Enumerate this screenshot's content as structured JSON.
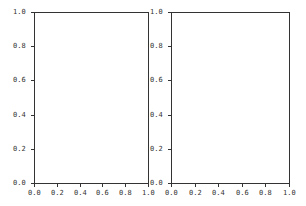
{
  "chart_data": [
    {
      "type": "line",
      "title": "",
      "xlabel": "",
      "ylabel": "",
      "xlim": [
        0.0,
        1.0
      ],
      "ylim": [
        0.0,
        1.0
      ],
      "grid": false,
      "series": [],
      "xticks": [
        "0.0",
        "0.2",
        "0.4",
        "0.6",
        "0.8",
        "1.0"
      ],
      "yticks": [
        "0.0",
        "0.2",
        "0.4",
        "0.6",
        "0.8",
        "1.0"
      ]
    },
    {
      "type": "line",
      "title": "",
      "xlabel": "",
      "ylabel": "",
      "xlim": [
        0.0,
        1.0
      ],
      "ylim": [
        0.0,
        1.0
      ],
      "grid": false,
      "series": [],
      "xticks": [
        "0.0",
        "0.2",
        "0.4",
        "0.6",
        "0.8",
        "1.0"
      ],
      "yticks": [
        "0.0",
        "0.2",
        "0.4",
        "0.6",
        "0.8",
        "1.0"
      ]
    }
  ],
  "colors": {
    "axis": "#333333",
    "background": "#ffffff"
  }
}
